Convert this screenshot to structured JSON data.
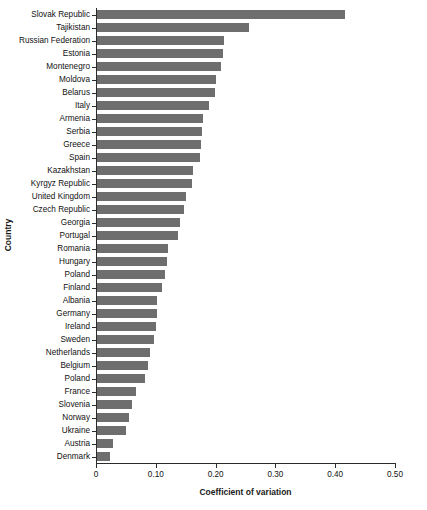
{
  "chart_data": {
    "type": "bar",
    "orientation": "horizontal",
    "title": "",
    "xlabel": "Coefficient of variation",
    "ylabel": "Country",
    "xlim": [
      0,
      0.5
    ],
    "xticks": [
      0,
      0.1,
      0.2,
      0.3,
      0.4,
      0.5
    ],
    "xticklabels": [
      "0",
      "0.10",
      "0.20",
      "0.30",
      "0.40",
      "0.50"
    ],
    "grid": false,
    "legend": false,
    "bar_color": "#6e6e6e",
    "categories": [
      "Slovak Republic",
      "Tajikistan",
      "Russian Federation",
      "Estonia",
      "Montenegro",
      "Moldova",
      "Belarus",
      "Italy",
      "Armenia",
      "Serbia",
      "Greece",
      "Spain",
      "Kazakhstan",
      "Kyrgyz Republic",
      "United Kingdom",
      "Czech Republic",
      "Georgia",
      "Portugal",
      "Romania",
      "Hungary",
      "Poland",
      "Finland",
      "Albania",
      "Germany",
      "Ireland",
      "Sweden",
      "Netherlands",
      "Belgium",
      "Poland",
      "France",
      "Slovenia",
      "Norway",
      "Ukraine",
      "Austria",
      "Denmark"
    ],
    "values": [
      0.415,
      0.254,
      0.212,
      0.21,
      0.208,
      0.199,
      0.197,
      0.187,
      0.177,
      0.176,
      0.174,
      0.172,
      0.16,
      0.159,
      0.148,
      0.146,
      0.139,
      0.136,
      0.119,
      0.117,
      0.114,
      0.108,
      0.101,
      0.1,
      0.099,
      0.095,
      0.089,
      0.086,
      0.08,
      0.066,
      0.058,
      0.054,
      0.049,
      0.027,
      0.022
    ]
  }
}
